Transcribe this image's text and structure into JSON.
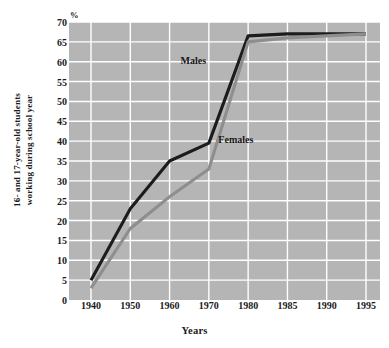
{
  "chart_data": {
    "type": "line",
    "title": "",
    "subtitle": "",
    "xlabel": "Years",
    "ylabel": "16- and 17-year-old students working during school year",
    "ylabel_lines": [
      "16- and 17-year-old students",
      "working during school year"
    ],
    "yunit": "%",
    "x": [
      1940,
      1950,
      1960,
      1970,
      1980,
      1985,
      1990,
      1995
    ],
    "categories": [
      "1940",
      "1950",
      "1960",
      "1970",
      "1980",
      "1985",
      "1990",
      "1995"
    ],
    "xtick_labels": [
      "1940",
      "1950",
      "1960",
      "1970",
      "1980",
      "1985",
      "1990",
      "1995"
    ],
    "ytick_labels": [
      "0",
      "5",
      "10",
      "15",
      "20",
      "25",
      "30",
      "35",
      "40",
      "45",
      "50",
      "55",
      "60",
      "65",
      "70"
    ],
    "ytick_values": [
      0,
      5,
      10,
      15,
      20,
      25,
      30,
      35,
      40,
      45,
      50,
      55,
      60,
      65,
      70
    ],
    "ylim": [
      0,
      70
    ],
    "xlim": [
      1935,
      1998
    ],
    "grid": true,
    "grid_color": "#ffffff",
    "plot_background": "#b5b5b5",
    "legend_position": "inline-annotations",
    "series": [
      {
        "name": "Males",
        "color": "#1c1c1c",
        "values": [
          5,
          23,
          35,
          39.5,
          66.5,
          67,
          67,
          67
        ],
        "annotation": {
          "text": "Males",
          "x": 1974,
          "y": 60
        }
      },
      {
        "name": "Females",
        "color": "#8e8e8e",
        "values": [
          3,
          18,
          26,
          33,
          65,
          66,
          66.5,
          67
        ],
        "annotation": {
          "text": "Females",
          "x": 1977,
          "y": 40
        }
      }
    ]
  }
}
